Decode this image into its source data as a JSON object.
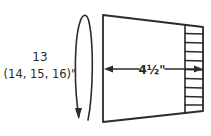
{
  "diagram": {
    "type": "knitting-schematic",
    "circumference_label": {
      "line1": "13",
      "line2": "(14, 15, 16)\""
    },
    "width_label": "4½\"",
    "ribbing": {
      "rows": 10
    },
    "colors": {
      "line": "#2b2b2b",
      "text": "#2a2a2a",
      "background": "#ffffff"
    }
  }
}
